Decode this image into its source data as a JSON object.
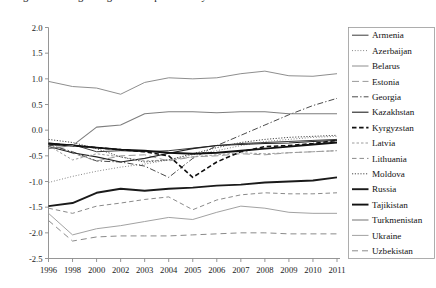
{
  "figure": {
    "clipped_title": "Figure 3. Change in agricultural productivity",
    "width": 436,
    "height": 288
  },
  "chart_data": {
    "type": "line",
    "title": "",
    "xlabel": "",
    "ylabel": "",
    "grid": false,
    "legend_position": "right",
    "ylim": [
      -2.5,
      2.0
    ],
    "ytick_step": 0.5,
    "ytick_labels": [
      "2.0",
      "1.5",
      "1.0",
      "0.5",
      "0.0",
      "-0.5",
      "-1.0",
      "-1.5",
      "-2.0",
      "-2.5"
    ],
    "ytick_values": [
      2.0,
      1.5,
      1.0,
      0.5,
      0.0,
      -0.5,
      -1.0,
      -1.5,
      -2.0,
      -2.5
    ],
    "categories": [
      "1996",
      "1998",
      "2000",
      "2002",
      "2003",
      "2004",
      "2005",
      "2006",
      "2007",
      "2008",
      "2009",
      "2010",
      "2011"
    ],
    "series": [
      {
        "name": "Armenia",
        "color": "#3a3a3a",
        "width": 1.0,
        "dash": "none",
        "values": [
          -0.3,
          -0.28,
          -0.42,
          -0.4,
          -0.42,
          -0.4,
          -0.35,
          -0.3,
          -0.26,
          -0.24,
          -0.22,
          -0.2,
          -0.18
        ]
      },
      {
        "name": "Azerbaijan",
        "color": "#7a7a7a",
        "width": 1.0,
        "dash": "dotted-fine",
        "values": [
          -1.02,
          -0.9,
          -0.8,
          -0.72,
          -0.66,
          -0.58,
          -0.48,
          -0.4,
          -0.3,
          -0.22,
          -0.18,
          -0.14,
          -0.12
        ]
      },
      {
        "name": "Belarus",
        "color": "#8e8e8e",
        "width": 1.0,
        "dash": "none",
        "values": [
          0.95,
          0.85,
          0.82,
          0.7,
          0.93,
          1.02,
          1.0,
          1.02,
          1.1,
          1.15,
          1.06,
          1.05,
          1.1
        ]
      },
      {
        "name": "Estonia",
        "color": "#9a9a9a",
        "width": 1.0,
        "dash": "long-dash",
        "values": [
          -0.25,
          -0.45,
          -0.6,
          -0.5,
          -0.48,
          -0.6,
          -0.52,
          -0.5,
          -0.46,
          -0.48,
          -0.44,
          -0.42,
          -0.4
        ]
      },
      {
        "name": "Georgia",
        "color": "#4a4a4a",
        "width": 1.0,
        "dash": "dash-dot",
        "values": [
          -0.28,
          -0.42,
          -0.6,
          -0.62,
          -0.7,
          -0.92,
          -0.55,
          -0.3,
          -0.1,
          0.1,
          0.3,
          0.48,
          0.62
        ]
      },
      {
        "name": "Kazakhstan",
        "color": "#222222",
        "width": 1.1,
        "dash": "none",
        "values": [
          -0.32,
          -0.44,
          -0.52,
          -0.62,
          -0.55,
          -0.45,
          -0.36,
          -0.3,
          -0.28,
          -0.26,
          -0.25,
          -0.22,
          -0.2
        ]
      },
      {
        "name": "Kyrgyzstan",
        "color": "#111111",
        "width": 1.6,
        "dash": "heavy-dash",
        "values": [
          -0.26,
          -0.3,
          -0.34,
          -0.38,
          -0.42,
          -0.5,
          -0.92,
          -0.62,
          -0.42,
          -0.32,
          -0.3,
          -0.26,
          -0.2
        ]
      },
      {
        "name": "Latvia",
        "color": "#9c9c9c",
        "width": 1.0,
        "dash": "short-dash",
        "values": [
          -0.3,
          -0.58,
          -0.46,
          -0.52,
          -0.6,
          -0.58,
          -0.52,
          -0.48,
          -0.44,
          -0.46,
          -0.44,
          -0.42,
          -0.4
        ]
      },
      {
        "name": "Lithuania",
        "color": "#8a8a8a",
        "width": 1.0,
        "dash": "med-dash",
        "values": [
          -1.52,
          -1.62,
          -1.48,
          -1.42,
          -1.35,
          -1.3,
          -1.55,
          -1.36,
          -1.26,
          -1.22,
          -1.24,
          -1.24,
          -1.22
        ]
      },
      {
        "name": "Moldova",
        "color": "#4a4a4a",
        "width": 1.0,
        "dash": "dotted",
        "values": [
          -0.18,
          -0.24,
          -0.36,
          -0.52,
          -0.62,
          -0.58,
          -0.46,
          -0.34,
          -0.24,
          -0.18,
          -0.14,
          -0.12,
          -0.1
        ]
      },
      {
        "name": "Russia",
        "color": "#1a1a1a",
        "width": 1.9,
        "dash": "none",
        "values": [
          -1.48,
          -1.42,
          -1.22,
          -1.14,
          -1.18,
          -1.14,
          -1.12,
          -1.08,
          -1.06,
          -1.02,
          -1.0,
          -0.98,
          -0.92
        ]
      },
      {
        "name": "Tajikistan",
        "color": "#111111",
        "width": 1.9,
        "dash": "none",
        "values": [
          -0.26,
          -0.3,
          -0.34,
          -0.38,
          -0.4,
          -0.44,
          -0.46,
          -0.44,
          -0.4,
          -0.36,
          -0.32,
          -0.28,
          -0.24
        ]
      },
      {
        "name": "Turkmenistan",
        "color": "#7e7e7e",
        "width": 1.1,
        "dash": "none",
        "values": [
          -0.36,
          -0.3,
          0.06,
          0.1,
          0.32,
          0.36,
          0.36,
          0.34,
          0.36,
          0.36,
          0.32,
          0.32,
          0.32
        ]
      },
      {
        "name": "Ukraine",
        "color": "#a2a2a2",
        "width": 1.0,
        "dash": "none",
        "values": [
          -1.62,
          -2.04,
          -1.92,
          -1.86,
          -1.78,
          -1.7,
          -1.74,
          -1.6,
          -1.48,
          -1.52,
          -1.6,
          -1.62,
          -1.62
        ]
      },
      {
        "name": "Uzbekistan",
        "color": "#8a8a8a",
        "width": 1.0,
        "dash": "wide-dash",
        "values": [
          -1.76,
          -2.16,
          -2.08,
          -2.06,
          -2.06,
          -2.06,
          -2.04,
          -2.02,
          -2.0,
          -2.0,
          -2.02,
          -2.02,
          -2.02
        ]
      }
    ]
  },
  "legend": {
    "items": [
      "Armenia",
      "Azerbaijan",
      "Belarus",
      "Estonia",
      "Georgia",
      "Kazakhstan",
      "Kyrgyzstan",
      "Latvia",
      "Lithuania",
      "Moldova",
      "Russia",
      "Tajikistan",
      "Turkmenistan",
      "Ukraine",
      "Uzbekistan"
    ]
  }
}
